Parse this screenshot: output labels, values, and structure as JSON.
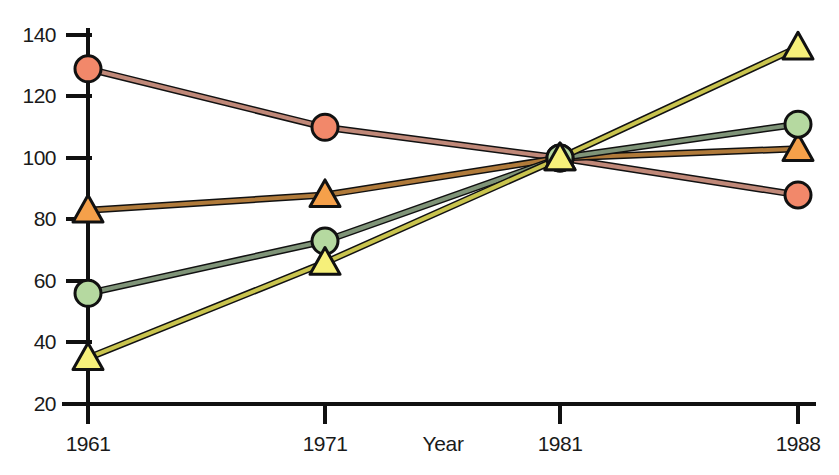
{
  "chart_data": {
    "type": "line",
    "title": "",
    "subtitle": "",
    "xlabel": "Year",
    "ylabel": "",
    "x": [
      1961,
      1971,
      1981,
      1988
    ],
    "categories": [
      "1961",
      "1971",
      "1981",
      "1988"
    ],
    "xtick_labels": [
      "1961",
      "1971",
      "1981",
      "1988"
    ],
    "ytick_labels": [
      "20",
      "40",
      "60",
      "80",
      "100",
      "120",
      "140"
    ],
    "ytick_values": [
      20,
      40,
      60,
      80,
      100,
      120,
      140
    ],
    "xlim": [
      1961,
      1988
    ],
    "ylim": [
      20,
      145
    ],
    "grid": false,
    "legend": "none",
    "marker_note": "index = 100 at 1981; all four series converge at 1981",
    "series": [
      {
        "name": "salmon-circle-series",
        "marker": "circle",
        "fill_color": "#f2886a",
        "line_color": "#c08878",
        "edge_color": "#111111",
        "values": [
          129,
          110,
          100,
          88
        ]
      },
      {
        "name": "orange-triangle-series",
        "marker": "triangle",
        "fill_color": "#f5a04a",
        "line_color": "#b07a3a",
        "edge_color": "#111111",
        "values": [
          83,
          88,
          100,
          103
        ]
      },
      {
        "name": "green-circle-series",
        "marker": "circle",
        "fill_color": "#b5d9a0",
        "line_color": "#7f9478",
        "edge_color": "#111111",
        "values": [
          56,
          73,
          100,
          111
        ]
      },
      {
        "name": "yellow-triangle-series",
        "marker": "triangle",
        "fill_color": "#f6f07a",
        "line_color": "#c9c44e",
        "edge_color": "#111111",
        "values": [
          35,
          66,
          100,
          136
        ]
      }
    ]
  },
  "axes": {
    "x_title": "Year",
    "axis_color": "#111111"
  }
}
